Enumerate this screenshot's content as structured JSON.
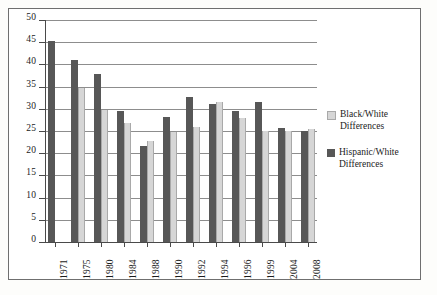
{
  "chart_data": {
    "type": "bar",
    "title": "",
    "subtitle": "",
    "xlabel": "",
    "ylabel": "",
    "ylim": [
      0,
      50
    ],
    "yticks": [
      0,
      5,
      10,
      15,
      20,
      25,
      30,
      35,
      40,
      45,
      50
    ],
    "ytick_labels": [
      "0",
      "5",
      "10",
      "15",
      "20",
      "25",
      "30",
      "35",
      "40",
      "45",
      "50"
    ],
    "grid": true,
    "legend_position": "right",
    "categories": [
      "1971",
      "1975",
      "1980",
      "1984",
      "1988",
      "1990",
      "1992",
      "1994",
      "1996",
      "1999",
      "2004",
      "2008"
    ],
    "series": [
      {
        "name": "Hispanic/White Differences",
        "color": "#575757",
        "values": [
          45.2,
          41.0,
          37.8,
          29.6,
          21.7,
          28.1,
          32.6,
          31.0,
          29.6,
          31.5,
          25.7,
          25.0
        ]
      },
      {
        "name": "Black/White Differences",
        "color": "#d6d6d6",
        "values": [
          null,
          34.8,
          29.7,
          26.7,
          22.8,
          24.8,
          26.0,
          31.5,
          28.0,
          24.9,
          24.9,
          25.5
        ]
      }
    ]
  },
  "legend": {
    "items": [
      {
        "label": "Black/White Differences",
        "swatch": "light"
      },
      {
        "label": "Hispanic/White Differences",
        "swatch": "dark"
      }
    ]
  }
}
